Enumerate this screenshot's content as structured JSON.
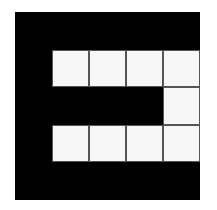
{
  "diagram": {
    "type": "binary-grid",
    "rows": 5,
    "cols": 5,
    "colors": {
      "filled": "#000000",
      "empty": "#f7f7f7",
      "line": "#555555"
    },
    "cells": [
      [
        1,
        1,
        1,
        1,
        1
      ],
      [
        1,
        0,
        0,
        0,
        0
      ],
      [
        1,
        1,
        1,
        1,
        0
      ],
      [
        1,
        0,
        0,
        0,
        0
      ],
      [
        1,
        1,
        1,
        1,
        1
      ]
    ]
  }
}
